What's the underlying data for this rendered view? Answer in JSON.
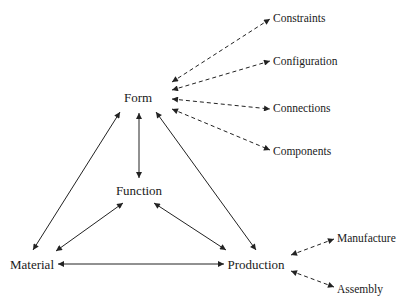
{
  "diagram": {
    "nodes": {
      "form": "Form",
      "function": "Function",
      "material": "Material",
      "production": "Production",
      "constraints": "Constraints",
      "configuration": "Configuration",
      "connections": "Connections",
      "components": "Components",
      "manufacture": "Manufacture",
      "assembly": "Assembly"
    },
    "edges": [
      {
        "from": "form",
        "to": "function",
        "style": "solid",
        "direction": "both"
      },
      {
        "from": "form",
        "to": "material",
        "style": "solid",
        "direction": "both"
      },
      {
        "from": "form",
        "to": "production",
        "style": "solid",
        "direction": "both"
      },
      {
        "from": "function",
        "to": "material",
        "style": "solid",
        "direction": "both"
      },
      {
        "from": "function",
        "to": "production",
        "style": "solid",
        "direction": "both"
      },
      {
        "from": "material",
        "to": "production",
        "style": "solid",
        "direction": "both"
      },
      {
        "from": "form",
        "to": "constraints",
        "style": "dashed",
        "direction": "both"
      },
      {
        "from": "form",
        "to": "configuration",
        "style": "dashed",
        "direction": "both"
      },
      {
        "from": "form",
        "to": "connections",
        "style": "dashed",
        "direction": "both"
      },
      {
        "from": "form",
        "to": "components",
        "style": "dashed",
        "direction": "both"
      },
      {
        "from": "production",
        "to": "manufacture",
        "style": "dashed",
        "direction": "both"
      },
      {
        "from": "production",
        "to": "assembly",
        "style": "dashed",
        "direction": "both"
      }
    ]
  }
}
